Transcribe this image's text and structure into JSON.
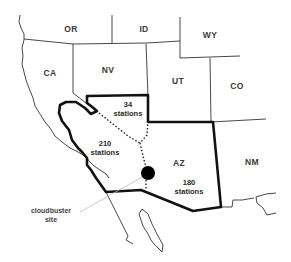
{
  "map": {
    "states": [
      {
        "code": "OR",
        "x": 71,
        "y": 29
      },
      {
        "code": "ID",
        "x": 144,
        "y": 29
      },
      {
        "code": "WY",
        "x": 210,
        "y": 35
      },
      {
        "code": "CA",
        "x": 50,
        "y": 73
      },
      {
        "code": "NV",
        "x": 108,
        "y": 70
      },
      {
        "code": "UT",
        "x": 178,
        "y": 81
      },
      {
        "code": "CO",
        "x": 237,
        "y": 86
      },
      {
        "code": "AZ",
        "x": 179,
        "y": 163
      },
      {
        "code": "NM",
        "x": 252,
        "y": 162
      }
    ],
    "regions": [
      {
        "name": "nevada-south",
        "count": "34",
        "unit": "stations",
        "x": 122,
        "y": 103
      },
      {
        "name": "california-south",
        "count": "210",
        "unit": "stations",
        "x": 104,
        "y": 148
      },
      {
        "name": "arizona",
        "count": "180",
        "unit": "stations",
        "x": 188,
        "y": 187
      }
    ],
    "cloudbuster": {
      "label_line1": "cloudbuster",
      "label_line2": "site",
      "label_x": 50,
      "label_y": 215,
      "marker_x": 148,
      "marker_y": 173
    },
    "colors": {
      "border": "#1a1a1a",
      "thin_border": "#333333",
      "marker": "#000000",
      "pointer": "#bbbbbb",
      "background": "#ffffff"
    }
  }
}
